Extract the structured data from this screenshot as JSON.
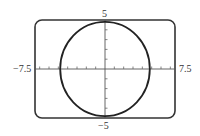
{
  "chart_data": {
    "type": "line",
    "title": "",
    "series": [
      {
        "name": "circle",
        "equation": "x^2 + y^2 = 23",
        "center": [
          0,
          0
        ],
        "radius": 4.8
      }
    ],
    "xlim": [
      -7.5,
      7.5
    ],
    "ylim": [
      -5,
      5
    ],
    "xscale": 1,
    "yscale": 1,
    "x_ticks": [
      -7,
      -6,
      -5,
      -4,
      -3,
      -2,
      -1,
      1,
      2,
      3,
      4,
      5,
      6,
      7
    ],
    "y_ticks": [
      -4,
      -3,
      -2,
      -1,
      1,
      2,
      3,
      4
    ],
    "xlabel": "",
    "ylabel": "",
    "grid": false,
    "legend": null
  },
  "labels": {
    "xmin": "−7.5",
    "xmax": "7.5",
    "ymax": "5",
    "ymin": "−5"
  },
  "colors": {
    "frame": "#333333",
    "curve": "#222222",
    "axes": "#555555"
  }
}
